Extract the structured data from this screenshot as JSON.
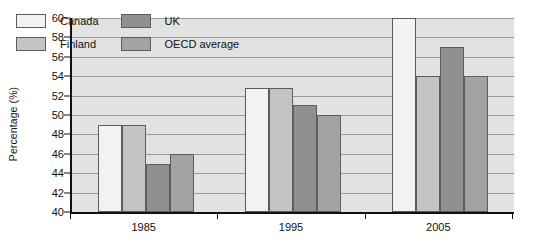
{
  "chart_data": {
    "type": "bar",
    "title": "",
    "xlabel": "",
    "ylabel": "Percentage (%)",
    "categories": [
      "1985",
      "1995",
      "2005"
    ],
    "ylim": [
      40,
      60
    ],
    "yticks": [
      40,
      42,
      44,
      46,
      48,
      50,
      52,
      54,
      56,
      58,
      60
    ],
    "ytick_labels": [
      "40",
      "42",
      "44",
      "46",
      "48",
      "50",
      "52",
      "54",
      "56",
      "58",
      "60"
    ],
    "grid": true,
    "legend_position": "upper-left-inside",
    "series": [
      {
        "name": "Canada",
        "color": "#f2f2f2",
        "values": [
          49,
          52.8,
          60
        ]
      },
      {
        "name": "Finland",
        "color": "#c3c3c3",
        "values": [
          49,
          52.8,
          54
        ]
      },
      {
        "name": "UK",
        "color": "#8f8f8f",
        "values": [
          45,
          51,
          57
        ]
      },
      {
        "name": "OECD average",
        "color": "#a3a3a3",
        "values": [
          46,
          50,
          54
        ]
      }
    ]
  },
  "legend": {
    "items": [
      {
        "label": "Canada",
        "color": "#f2f2f2"
      },
      {
        "label": "UK",
        "color": "#8f8f8f"
      },
      {
        "label": "Finland",
        "color": "#c3c3c3"
      },
      {
        "label": "OECD average",
        "color": "#a3a3a3"
      }
    ]
  },
  "axes": {
    "y_title": "Percentage (%)"
  },
  "colors": {
    "plot_background": "#e2e2e2",
    "gridline": "#9a9a9a",
    "axis": "#111111",
    "bar_border": "#5d5d5d"
  }
}
